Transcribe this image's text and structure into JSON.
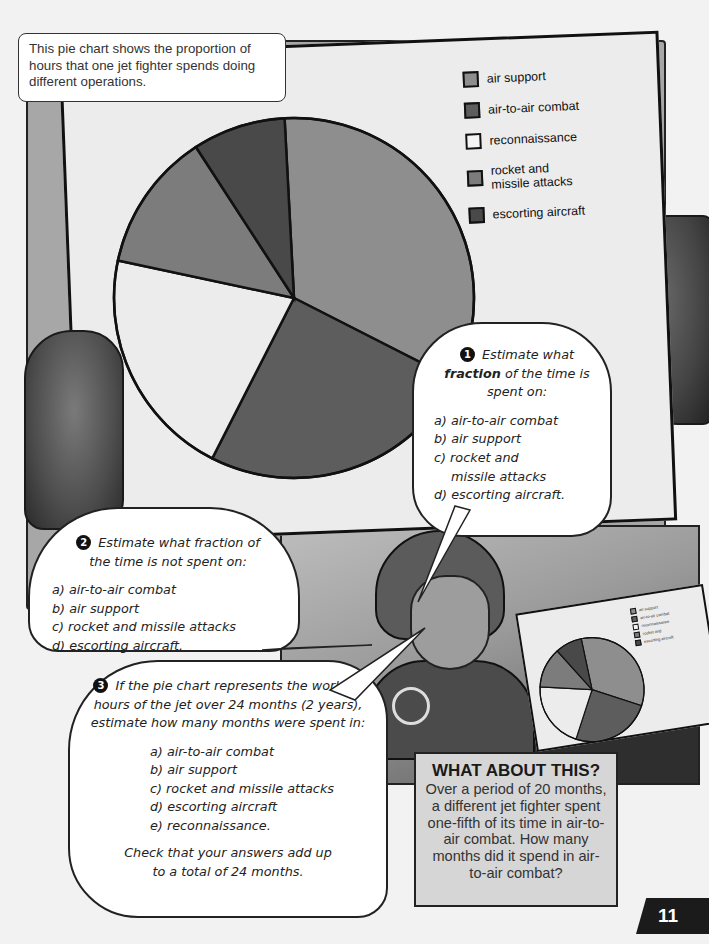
{
  "caption": {
    "text": "This pie chart shows the proportion of hours that one jet fighter spends doing different operations."
  },
  "chart_data": {
    "type": "pie",
    "title": "",
    "categories": [
      "air support",
      "air-to-air combat",
      "reconnaissance",
      "rocket and missile attacks",
      "escorting aircraft"
    ],
    "values": [
      8,
      6,
      5,
      3,
      2
    ],
    "fractions": [
      "1/3",
      "1/4",
      "5/24",
      "1/8",
      "1/12"
    ],
    "angles_deg": [
      120,
      90,
      75,
      45,
      30
    ],
    "start_angle_deg": -3,
    "direction": "clockwise",
    "colors": [
      "#8e8e8e",
      "#5d5d5d",
      "#ececec",
      "#7c7c7c",
      "#494949"
    ],
    "legend_position": "top-right",
    "legend": [
      "air support",
      "air-to-air combat",
      "reconnaissance",
      "rocket and missile attacks",
      "escorting aircraft"
    ]
  },
  "legend": {
    "items": [
      {
        "label": "air support",
        "color": "#8e8e8e"
      },
      {
        "label": "air-to-air combat",
        "color": "#5d5d5d"
      },
      {
        "label": "reconnaissance",
        "color": "#f2f2f2"
      },
      {
        "label_line1": "rocket and",
        "label_line2": "missile attacks",
        "color": "#7c7c7c"
      },
      {
        "label": "escorting aircraft",
        "color": "#494949"
      }
    ]
  },
  "question1": {
    "number": "1",
    "head_pre": "Estimate what",
    "head_bold": "fraction",
    "head_post": "of the time is spent on:",
    "items": [
      "a) air-to-air combat",
      "b) air support",
      "c) rocket and",
      "missile attacks",
      "d) escorting aircraft."
    ]
  },
  "question2": {
    "number": "2",
    "head": "Estimate what fraction of the time is not spent on:",
    "items": [
      "a) air-to-air combat",
      "b) air support",
      "c) rocket and missile attacks",
      "d) escorting aircraft."
    ]
  },
  "question3": {
    "number": "3",
    "head": "If the pie chart represents the working hours of the jet over 24 months (2 years), estimate how many months were spent in:",
    "items": [
      "a) air-to-air combat",
      "b) air support",
      "c) rocket and missile attacks",
      "d) escorting aircraft",
      "e) reconnaissance."
    ],
    "footer": "Check that your answers add up to a total of 24 months."
  },
  "what_about_this": {
    "title": "WHAT ABOUT THIS?",
    "body": "Over a period of 20 months, a different jet fighter spent one-fifth of its time in air-to-air combat. How many months did it spend in air-to-air combat?"
  },
  "page_number": "11"
}
